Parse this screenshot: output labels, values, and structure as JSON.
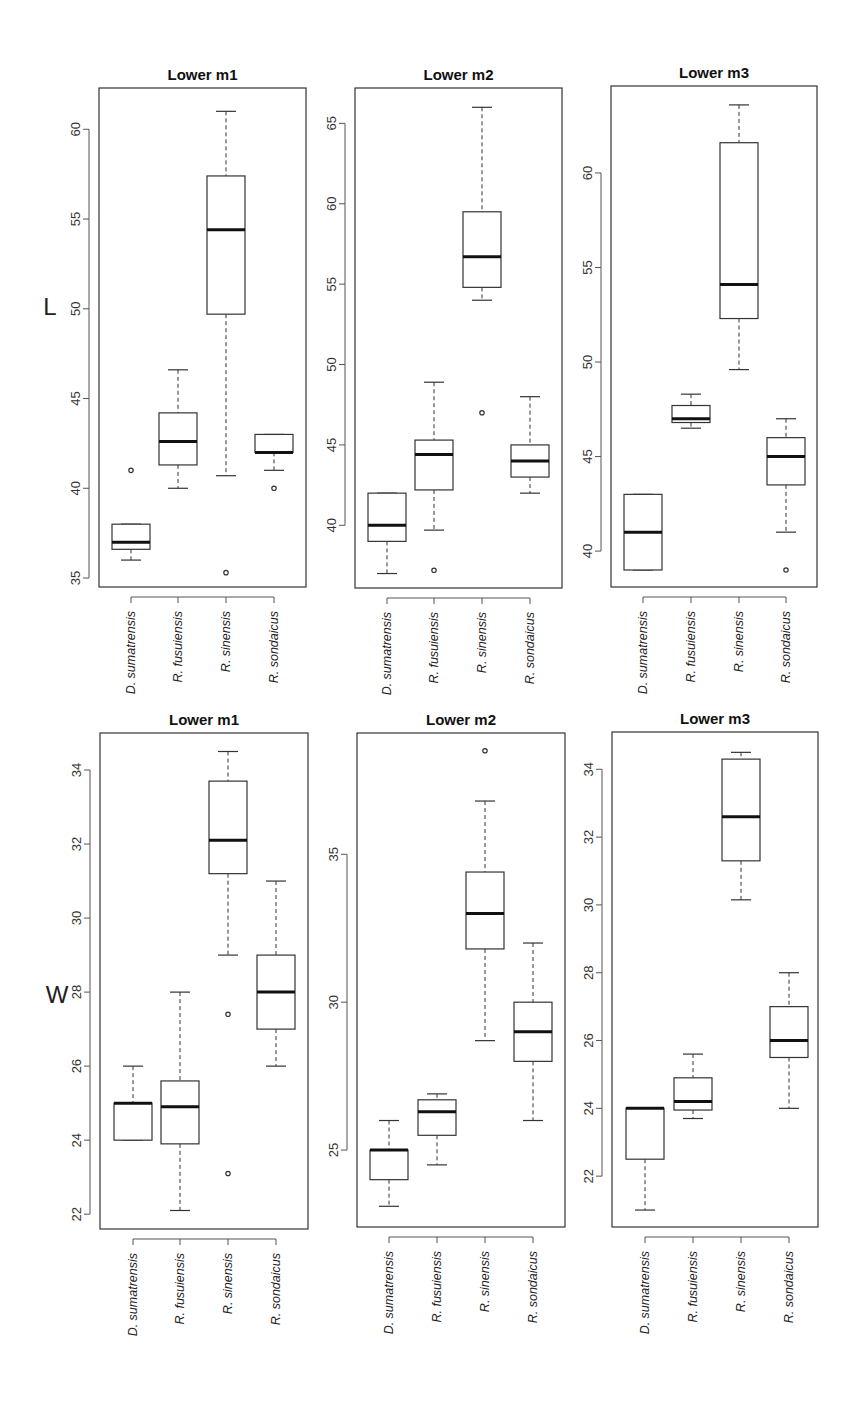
{
  "figure": {
    "row_labels": [
      "L",
      "W"
    ]
  },
  "chart_data": [
    {
      "type": "boxplot",
      "title": "Lower m1",
      "ylabel": "L",
      "categories": [
        "D. sumatrensis",
        "R. fusuiensis",
        "R. sinensis",
        "R. sondaicus"
      ],
      "yticks": [
        35,
        40,
        45,
        50,
        55,
        60
      ],
      "ylim": [
        34.5,
        62.3
      ],
      "boxes": [
        {
          "category": "D. sumatrensis",
          "whisker_low": 36,
          "q1": 36.6,
          "median": 37,
          "q3": 38,
          "whisker_high": 38,
          "outliers": [
            41
          ]
        },
        {
          "category": "R. fusuiensis",
          "whisker_low": 40,
          "q1": 41.3,
          "median": 42.6,
          "q3": 44.2,
          "whisker_high": 46.6,
          "outliers": []
        },
        {
          "category": "R. sinensis",
          "whisker_low": 40.7,
          "q1": 49.7,
          "median": 54.4,
          "q3": 57.4,
          "whisker_high": 61,
          "outliers": [
            35.3
          ]
        },
        {
          "category": "R. sondaicus",
          "whisker_low": 41,
          "q1": 42,
          "median": 42,
          "q3": 43,
          "whisker_high": 43,
          "outliers": [
            40
          ]
        }
      ]
    },
    {
      "type": "boxplot",
      "title": "Lower m2",
      "ylabel": "",
      "categories": [
        "D. sumatrensis",
        "R. fusuiensis",
        "R. sinensis",
        "R. sondaicus"
      ],
      "yticks": [
        40,
        45,
        50,
        55,
        60,
        65
      ],
      "ylim": [
        36.1,
        67.2
      ],
      "boxes": [
        {
          "category": "D. sumatrensis",
          "whisker_low": 37,
          "q1": 39,
          "median": 40,
          "q3": 42,
          "whisker_high": 42,
          "outliers": []
        },
        {
          "category": "R. fusuiensis",
          "whisker_low": 39.7,
          "q1": 42.2,
          "median": 44.4,
          "q3": 45.3,
          "whisker_high": 48.9,
          "outliers": [
            37.2
          ]
        },
        {
          "category": "R. sinensis",
          "whisker_low": 54,
          "q1": 54.8,
          "median": 56.7,
          "q3": 59.5,
          "whisker_high": 66,
          "outliers": [
            47
          ]
        },
        {
          "category": "R. sondaicus",
          "whisker_low": 42,
          "q1": 43,
          "median": 44,
          "q3": 45,
          "whisker_high": 48,
          "outliers": []
        }
      ]
    },
    {
      "type": "boxplot",
      "title": "Lower m3",
      "ylabel": "",
      "categories": [
        "D. sumatrensis",
        "R. fusuiensis",
        "R. sinensis",
        "R. sondaicus"
      ],
      "yticks": [
        40,
        45,
        50,
        55,
        60
      ],
      "ylim": [
        38.1,
        64.6
      ],
      "boxes": [
        {
          "category": "D. sumatrensis",
          "whisker_low": 39,
          "q1": 39,
          "median": 41,
          "q3": 43,
          "whisker_high": 43,
          "outliers": []
        },
        {
          "category": "R. fusuiensis",
          "whisker_low": 46.5,
          "q1": 46.8,
          "median": 47,
          "q3": 47.7,
          "whisker_high": 48.3,
          "outliers": []
        },
        {
          "category": "R. sinensis",
          "whisker_low": 49.6,
          "q1": 52.3,
          "median": 54.1,
          "q3": 61.6,
          "whisker_high": 63.6,
          "outliers": []
        },
        {
          "category": "R. sondaicus",
          "whisker_low": 41,
          "q1": 43.5,
          "median": 45,
          "q3": 46,
          "whisker_high": 47,
          "outliers": [
            39
          ]
        }
      ]
    },
    {
      "type": "boxplot",
      "title": "Lower m1",
      "ylabel": "W",
      "categories": [
        "D. sumatrensis",
        "R. fusuiensis",
        "R. sinensis",
        "R. sondaicus"
      ],
      "yticks": [
        22,
        24,
        26,
        28,
        30,
        32,
        34
      ],
      "ylim": [
        21.6,
        35.0
      ],
      "boxes": [
        {
          "category": "D. sumatrensis",
          "whisker_low": 24,
          "q1": 24,
          "median": 25,
          "q3": 25,
          "whisker_high": 26,
          "outliers": []
        },
        {
          "category": "R. fusuiensis",
          "whisker_low": 22.1,
          "q1": 23.9,
          "median": 24.9,
          "q3": 25.6,
          "whisker_high": 28,
          "outliers": []
        },
        {
          "category": "R. sinensis",
          "whisker_low": 29,
          "q1": 31.2,
          "median": 32.1,
          "q3": 33.7,
          "whisker_high": 34.5,
          "outliers": [
            27.4,
            23.1
          ]
        },
        {
          "category": "R. sondaicus",
          "whisker_low": 26,
          "q1": 27,
          "median": 28,
          "q3": 29,
          "whisker_high": 31,
          "outliers": []
        }
      ]
    },
    {
      "type": "boxplot",
      "title": "Lower m2",
      "ylabel": "",
      "categories": [
        "D. sumatrensis",
        "R. fusuiensis",
        "R. sinensis",
        "R. sondaicus"
      ],
      "yticks": [
        25,
        30,
        35
      ],
      "ylim": [
        22.4,
        39.1
      ],
      "boxes": [
        {
          "category": "D. sumatrensis",
          "whisker_low": 23.1,
          "q1": 24,
          "median": 25,
          "q3": 25,
          "whisker_high": 26,
          "outliers": []
        },
        {
          "category": "R. fusuiensis",
          "whisker_low": 24.5,
          "q1": 25.5,
          "median": 26.3,
          "q3": 26.7,
          "whisker_high": 26.9,
          "outliers": []
        },
        {
          "category": "R. sinensis",
          "whisker_low": 28.7,
          "q1": 31.8,
          "median": 33,
          "q3": 34.4,
          "whisker_high": 36.8,
          "outliers": [
            38.5
          ]
        },
        {
          "category": "R. sondaicus",
          "whisker_low": 26,
          "q1": 28,
          "median": 29,
          "q3": 30,
          "whisker_high": 32,
          "outliers": []
        }
      ]
    },
    {
      "type": "boxplot",
      "title": "Lower m3",
      "ylabel": "",
      "categories": [
        "D. sumatrensis",
        "R. fusuiensis",
        "R. sinensis",
        "R. sondaicus"
      ],
      "yticks": [
        22,
        24,
        26,
        28,
        30,
        32,
        34
      ],
      "ylim": [
        20.5,
        35.1
      ],
      "boxes": [
        {
          "category": "D. sumatrensis",
          "whisker_low": 21,
          "q1": 22.5,
          "median": 24,
          "q3": 24,
          "whisker_high": 24,
          "outliers": []
        },
        {
          "category": "R. fusuiensis",
          "whisker_low": 23.7,
          "q1": 23.95,
          "median": 24.2,
          "q3": 24.9,
          "whisker_high": 25.6,
          "outliers": []
        },
        {
          "category": "R. sinensis",
          "whisker_low": 30.15,
          "q1": 31.3,
          "median": 32.6,
          "q3": 34.3,
          "whisker_high": 34.5,
          "outliers": []
        },
        {
          "category": "R. sondaicus",
          "whisker_low": 24,
          "q1": 25.5,
          "median": 26,
          "q3": 27,
          "whisker_high": 28,
          "outliers": []
        }
      ]
    }
  ]
}
